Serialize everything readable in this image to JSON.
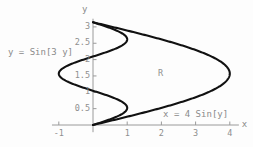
{
  "figure": {
    "background_color": "#fdfdfd",
    "axis_color": "#9a9a9a",
    "curve_color": "#111111",
    "text_color": "#8a8a8a",
    "region_label": "R",
    "x_axis_name": "x",
    "y_axis_name": "y",
    "curve_labels": {
      "left": "y = Sin[3 y]",
      "right": "x = 4 Sin[y]"
    }
  },
  "chart_data": {
    "type": "line",
    "title": "",
    "xlabel": "x",
    "ylabel": "y",
    "xlim": [
      -1.2,
      4.5
    ],
    "ylim": [
      -0.22,
      3.25
    ],
    "grid": false,
    "legend_position": "inline-annotations",
    "x_ticks": [
      -1,
      1,
      2,
      3,
      4
    ],
    "x_tick_labels": [
      "-1",
      "1",
      "2",
      "3",
      "4"
    ],
    "y_ticks": [
      0.5,
      1,
      1.5,
      2,
      2.5,
      3
    ],
    "y_tick_labels": [
      "0.5",
      "1",
      "1.5",
      "2",
      "2.5",
      "3"
    ],
    "annotations": [
      {
        "text": "R",
        "x": 1.9,
        "y": 1.6
      },
      {
        "text": "y = Sin[3 y]",
        "x": -1.1,
        "y": 2.25
      },
      {
        "text": "x = 4 Sin[y]",
        "x": 2.1,
        "y": 0.32
      }
    ],
    "series": [
      {
        "name": "x = 4 Sin[y]",
        "equation": "x = 4*sin(y)",
        "domain_y": [
          0,
          3.14159
        ],
        "points": [
          [
            0,
            0
          ],
          [
            0.398,
            0.1
          ],
          [
            0.794,
            0.2
          ],
          [
            1.182,
            0.3
          ],
          [
            1.558,
            0.4
          ],
          [
            1.918,
            0.5
          ],
          [
            2.258,
            0.6
          ],
          [
            2.575,
            0.7
          ],
          [
            2.865,
            0.8
          ],
          [
            3.125,
            0.9
          ],
          [
            3.353,
            1.0
          ],
          [
            3.546,
            1.1
          ],
          [
            3.702,
            1.2
          ],
          [
            3.82,
            1.3
          ],
          [
            3.898,
            1.4
          ],
          [
            3.937,
            1.5
          ],
          [
            3.999,
            1.5708
          ],
          [
            3.937,
            1.642
          ],
          [
            3.898,
            1.742
          ],
          [
            3.82,
            1.842
          ],
          [
            3.702,
            1.942
          ],
          [
            3.546,
            2.042
          ],
          [
            3.353,
            2.142
          ],
          [
            3.125,
            2.242
          ],
          [
            2.865,
            2.342
          ],
          [
            2.575,
            2.442
          ],
          [
            2.258,
            2.542
          ],
          [
            1.918,
            2.642
          ],
          [
            1.558,
            2.742
          ],
          [
            1.182,
            2.842
          ],
          [
            0.794,
            2.942
          ],
          [
            0.398,
            3.042
          ],
          [
            0,
            3.14159
          ]
        ]
      },
      {
        "name": "y = Sin[3 y]",
        "equation": "x = sin(3*y)",
        "domain_y": [
          0,
          3.14159
        ],
        "points": [
          [
            0,
            0
          ],
          [
            0.295,
            0.1
          ],
          [
            0.565,
            0.2
          ],
          [
            0.783,
            0.3
          ],
          [
            0.932,
            0.4
          ],
          [
            0.997,
            0.5
          ],
          [
            0.974,
            0.6
          ],
          [
            0.864,
            0.7
          ],
          [
            0.675,
            0.8
          ],
          [
            0.427,
            0.9
          ],
          [
            0.141,
            1.0
          ],
          [
            -0.158,
            1.1
          ],
          [
            -0.443,
            1.2
          ],
          [
            -0.688,
            1.3
          ],
          [
            -0.872,
            1.4
          ],
          [
            -0.978,
            1.5
          ],
          [
            -0.9998,
            1.5708
          ],
          [
            -0.994,
            1.62
          ],
          [
            -0.921,
            1.7
          ],
          [
            -0.772,
            1.8
          ],
          [
            -0.558,
            1.9
          ],
          [
            -0.296,
            2.0
          ],
          [
            -0.012,
            2.1
          ],
          [
            0.272,
            2.2
          ],
          [
            0.525,
            2.3
          ],
          [
            0.725,
            2.4
          ],
          [
            0.857,
            2.5
          ],
          [
            0.912,
            2.6
          ],
          [
            0.885,
            2.7
          ],
          [
            0.779,
            2.8
          ],
          [
            0.603,
            2.9
          ],
          [
            0.373,
            3.0
          ],
          [
            0.107,
            3.1
          ],
          [
            0,
            3.14159
          ]
        ]
      }
    ]
  }
}
